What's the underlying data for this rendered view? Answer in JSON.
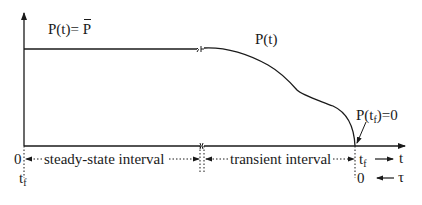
{
  "labels": {
    "steady_formula_prefix": "P(t)= ",
    "steady_formula_symbol": "P",
    "curve_label": "P(t)",
    "terminal_condition_prefix": "P(t",
    "terminal_condition_sub": "f",
    "terminal_condition_suffix": ")=0",
    "origin": "0",
    "origin_tf_main": "t",
    "origin_tf_sub": "f",
    "steady_interval": "steady-state interval",
    "transient_interval": "transient interval",
    "end_tf_main": "t",
    "end_tf_sub": "f",
    "end_zero": "0",
    "t_axis": "t",
    "tau_axis": "τ"
  },
  "colors": {
    "line": "#1a1a1a",
    "background": "#ffffff"
  }
}
